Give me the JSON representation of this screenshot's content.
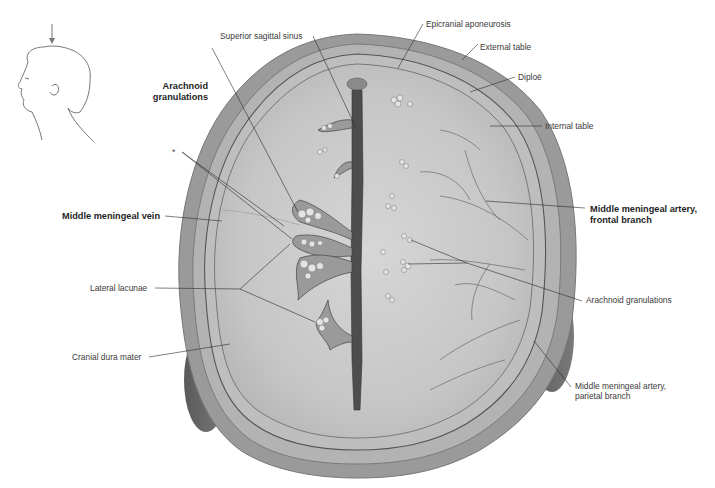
{
  "figure": {
    "orientation_icon": "head-profile-with-downward-arrow-icon",
    "colors": {
      "background": "#ffffff",
      "scalp": "#8f8f8f",
      "bone": "#a9a9a9",
      "dura": "#c9c9c9",
      "sinus": "#4a4a4a",
      "leader_line": "#2b2b2b",
      "label_text": "#3a3a3a"
    }
  },
  "labels": {
    "superior_sagittal_sinus": "Superior sagittal sinus",
    "epicranial_aponeurosis": "Epicranial aponeurosis",
    "external_table": "External table",
    "diploe": "Diploë",
    "internal_table": "Internal table",
    "arachnoid_granulations_bold_1": "Arachnoid",
    "arachnoid_granulations_bold_2": "granulations",
    "asterisk": "*",
    "middle_meningeal_vein": "Middle meningeal vein",
    "mma_frontal_1": "Middle meningeal artery,",
    "mma_frontal_2": "frontal branch",
    "lateral_lacunae": "Lateral lacunae",
    "arachnoid_granulations": "Arachnoid granulations",
    "cranial_dura_mater": "Cranial dura mater",
    "mma_parietal_1": "Middle meningeal artery,",
    "mma_parietal_2": "parietal branch"
  }
}
